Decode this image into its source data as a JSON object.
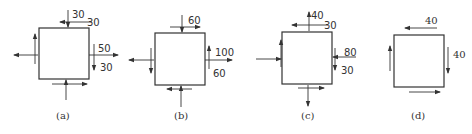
{
  "figure": {
    "panels": [
      {
        "id": "a",
        "caption": "(a)",
        "labels": {
          "top_normal": "30",
          "top_shear": "30",
          "right_normal": "50",
          "right_shear": "30"
        },
        "normal_x": "tension",
        "normal_y": "compression",
        "shear_right": "down",
        "shear_top": "left"
      },
      {
        "id": "b",
        "caption": "(b)",
        "labels": {
          "top_shear": "60",
          "right_normal": "100",
          "right_shear": "60"
        },
        "normal_x": "tension",
        "normal_y": "none",
        "shear_right": "up",
        "shear_top": "right"
      },
      {
        "id": "c",
        "caption": "(c)",
        "labels": {
          "top_normal": "40",
          "top_shear": "30",
          "right_normal": "80",
          "right_shear": "30"
        },
        "normal_x": "compression",
        "normal_y": "tension",
        "shear_right": "down",
        "shear_top": "left"
      },
      {
        "id": "d",
        "caption": "(d)",
        "labels": {
          "top_shear": "40",
          "right_shear": "40"
        },
        "normal_x": "none",
        "normal_y": "none",
        "shear_right": "down",
        "shear_top": "left"
      }
    ]
  }
}
